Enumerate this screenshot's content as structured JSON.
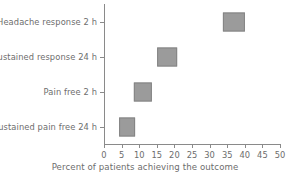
{
  "chart_data": {
    "type": "scatter",
    "title": "",
    "xlabel": "Percent of patients achieving the outcome",
    "ylabel": "",
    "xlim": [
      0,
      50
    ],
    "xticks": [
      0,
      5,
      10,
      15,
      20,
      25,
      30,
      35,
      40,
      45,
      50
    ],
    "grid": false,
    "legend": null,
    "marker_shape": "square",
    "marker_color": "#9b9b9b",
    "marker_border_color": "#848484",
    "axis_color": "#8a8a8a",
    "text_color": "#6d6d6d",
    "categories": [
      "Headache response 2 h",
      "Sustained response 24 h",
      "Pain free 2 h",
      "Sustained pain free 24 h"
    ],
    "values": [
      37,
      18,
      11,
      6.5
    ],
    "points": [
      {
        "category": "Headache response 2 h",
        "value": 37,
        "marker_width_units": 6.3,
        "marker_height_px": 19
      },
      {
        "category": "Sustained response 24 h",
        "value": 18,
        "marker_width_units": 5.6,
        "marker_height_px": 19
      },
      {
        "category": "Pain free 2 h",
        "value": 11,
        "marker_width_units": 5.2,
        "marker_height_px": 19
      },
      {
        "category": "Sustained pain free 24 h",
        "value": 6.5,
        "marker_width_units": 4.5,
        "marker_height_px": 19
      }
    ],
    "xtick_labels": [
      "0",
      "5",
      "10",
      "15",
      "20",
      "25",
      "30",
      "35",
      "40",
      "45",
      "50"
    ]
  }
}
